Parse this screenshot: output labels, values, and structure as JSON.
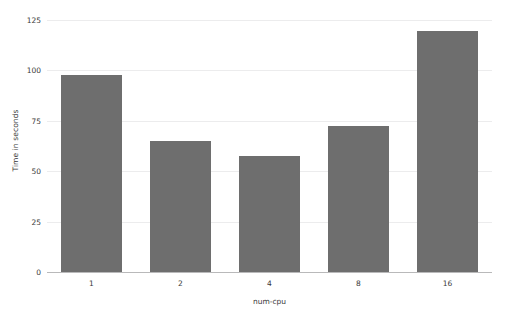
{
  "chart_data": {
    "type": "bar",
    "title": "",
    "categories": [
      "1",
      "2",
      "4",
      "8",
      "16"
    ],
    "values": [
      97.5,
      65,
      57.5,
      72.5,
      119.5
    ],
    "xlabel": "num-cpu",
    "ylabel": "Time in seconds",
    "ylim": [
      0,
      125
    ],
    "yticks": [
      0,
      25,
      50,
      75,
      100,
      125
    ],
    "ytick_labels": [
      "0",
      "25",
      "50",
      "75",
      "100",
      "125"
    ],
    "grid": "horizontal",
    "legend": "none",
    "bar_color": "#6e6e6e",
    "gridline_color": "#ececed",
    "axis_color": "#b9b9ba",
    "text_color": "#3a3a3a",
    "background": "#ffffff"
  }
}
